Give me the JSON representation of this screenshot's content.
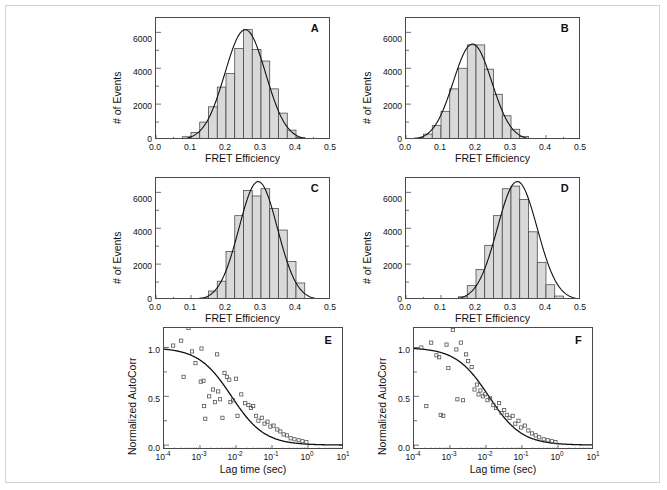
{
  "figure": {
    "panel_letters": [
      "A",
      "B",
      "C",
      "D",
      "E",
      "F"
    ],
    "axis_titles": {
      "fret_x": "FRET Efficiency",
      "events_y": "# of Events",
      "lag_x": "Lag time (sec)",
      "autocorr_y": "Normalized AutoCorr"
    },
    "hist_xticks": [
      "0.0",
      "0.1",
      "0.2",
      "0.3",
      "0.4",
      "0.5"
    ],
    "hist_yticks": [
      "0",
      "2000",
      "4000",
      "6000"
    ],
    "corr_yticks": [
      "0.0",
      "0.5",
      "1.0"
    ],
    "corr_xticks": [
      "10-4",
      "10-3",
      "10-2",
      "10-1",
      "100",
      "101"
    ],
    "corr_xtick_mantissa": "10",
    "corr_xtick_exponents": [
      "-4",
      "-3",
      "-2",
      "-1",
      "0",
      "1"
    ],
    "colors": {
      "bar_fill": "#d9d9d9",
      "bar_edge": "#3a3a3a",
      "fit_line": "#111111",
      "axis": "#4a4a4a",
      "marker_edge": "#555555",
      "page_border": "#d2d2d2",
      "text": "#111111"
    }
  },
  "chart_data": [
    {
      "type": "bar",
      "panel": "A",
      "title": "",
      "xlabel": "FRET Efficiency",
      "ylabel": "# of Events",
      "xlim": [
        0.0,
        0.5
      ],
      "ylim": [
        0,
        6800
      ],
      "grid": false,
      "bin_width": 0.025,
      "bin_centers": [
        0.0625,
        0.0875,
        0.1125,
        0.1375,
        0.1625,
        0.1875,
        0.2125,
        0.2375,
        0.2625,
        0.2875,
        0.3125,
        0.3375,
        0.3625,
        0.3875,
        0.4125
      ],
      "values": [
        70,
        180,
        420,
        1000,
        1850,
        2950,
        3700,
        5100,
        6150,
        5050,
        4400,
        2850,
        1500,
        550,
        150
      ],
      "fit": {
        "type": "gaussian",
        "amplitude": 6150,
        "center": 0.255,
        "sigma": 0.058
      }
    },
    {
      "type": "bar",
      "panel": "B",
      "title": "",
      "xlabel": "FRET Efficiency",
      "ylabel": "# of Events",
      "xlim": [
        0.0,
        0.5
      ],
      "ylim": [
        0,
        6800
      ],
      "grid": false,
      "bin_width": 0.025,
      "bin_centers": [
        0.0375,
        0.0625,
        0.0875,
        0.1125,
        0.1375,
        0.1625,
        0.1875,
        0.2125,
        0.2375,
        0.2625,
        0.2875,
        0.3125,
        0.3375,
        0.3625
      ],
      "values": [
        120,
        330,
        800,
        1600,
        2850,
        4000,
        5300,
        5300,
        3950,
        2550,
        1350,
        600,
        200,
        60
      ],
      "fit": {
        "type": "gaussian",
        "amplitude": 5350,
        "center": 0.19,
        "sigma": 0.055
      }
    },
    {
      "type": "bar",
      "panel": "C",
      "title": "",
      "xlabel": "FRET Efficiency",
      "ylabel": "# of Events",
      "xlim": [
        0.0,
        0.5
      ],
      "ylim": [
        0,
        6800
      ],
      "grid": false,
      "bin_width": 0.025,
      "bin_centers": [
        0.1375,
        0.1625,
        0.1875,
        0.2125,
        0.2375,
        0.2625,
        0.2875,
        0.3125,
        0.3375,
        0.3625,
        0.3875,
        0.4125
      ],
      "values": [
        120,
        500,
        1050,
        2700,
        4700,
        6100,
        5800,
        6200,
        5100,
        3900,
        2150,
        950
      ],
      "fit": {
        "type": "gaussian",
        "amplitude": 6600,
        "center": 0.292,
        "sigma": 0.055
      }
    },
    {
      "type": "bar",
      "panel": "D",
      "title": "",
      "xlabel": "FRET Efficiency",
      "ylabel": "# of Events",
      "xlim": [
        0.0,
        0.5
      ],
      "ylim": [
        0,
        6800
      ],
      "grid": false,
      "bin_width": 0.025,
      "bin_centers": [
        0.1625,
        0.1875,
        0.2125,
        0.2375,
        0.2625,
        0.2875,
        0.3125,
        0.3375,
        0.3625,
        0.3875,
        0.4125,
        0.4375
      ],
      "values": [
        180,
        800,
        1700,
        3050,
        4700,
        6200,
        6350,
        5600,
        3800,
        2100,
        850,
        220
      ],
      "fit": {
        "type": "gaussian",
        "amplitude": 6600,
        "center": 0.318,
        "sigma": 0.057
      }
    },
    {
      "type": "scatter",
      "panel": "E",
      "title": "",
      "xlabel": "Lag time (sec)",
      "ylabel": "Normalized AutoCorr",
      "xscale": "log",
      "xlim": [
        0.0001,
        10
      ],
      "ylim": [
        -0.05,
        1.2
      ],
      "grid": false,
      "marker": "open-square",
      "points": [
        [
          0.00018,
          1.02
        ],
        [
          0.0003,
          1.07
        ],
        [
          0.00048,
          1.2
        ],
        [
          0.0006,
          0.96
        ],
        [
          0.00035,
          0.7
        ],
        [
          0.00075,
          0.84
        ],
        [
          0.0011,
          0.99
        ],
        [
          0.00105,
          0.65
        ],
        [
          0.00125,
          0.66
        ],
        [
          0.0013,
          0.4
        ],
        [
          0.0014,
          0.27
        ],
        [
          0.0018,
          0.5
        ],
        [
          0.0023,
          0.57
        ],
        [
          0.0026,
          0.44
        ],
        [
          0.003,
          0.93
        ],
        [
          0.0032,
          0.55
        ],
        [
          0.0036,
          0.47
        ],
        [
          0.0042,
          0.28
        ],
        [
          0.0048,
          0.74
        ],
        [
          0.0056,
          0.7
        ],
        [
          0.0065,
          0.67
        ],
        [
          0.007,
          0.44
        ],
        [
          0.0083,
          0.46
        ],
        [
          0.01,
          0.68
        ],
        [
          0.011,
          0.3
        ],
        [
          0.014,
          0.52
        ],
        [
          0.018,
          0.43
        ],
        [
          0.022,
          0.41
        ],
        [
          0.026,
          0.38
        ],
        [
          0.03,
          0.4
        ],
        [
          0.036,
          0.3
        ],
        [
          0.042,
          0.25
        ],
        [
          0.052,
          0.28
        ],
        [
          0.062,
          0.22
        ],
        [
          0.075,
          0.24
        ],
        [
          0.09,
          0.19
        ],
        [
          0.11,
          0.2
        ],
        [
          0.14,
          0.16
        ],
        [
          0.17,
          0.14
        ],
        [
          0.21,
          0.11
        ],
        [
          0.26,
          0.1
        ],
        [
          0.33,
          0.07
        ],
        [
          0.42,
          0.06
        ],
        [
          0.55,
          0.05
        ],
        [
          0.7,
          0.04
        ],
        [
          0.9,
          0.03
        ]
      ],
      "fit": {
        "type": "sigmoid-decay",
        "amplitude": 1.0,
        "tau": 0.0075,
        "label": ""
      }
    },
    {
      "type": "scatter",
      "panel": "F",
      "title": "",
      "xlabel": "Lag time (sec)",
      "ylabel": "Normalized AutoCorr",
      "xscale": "log",
      "xlim": [
        0.0001,
        10
      ],
      "ylim": [
        -0.05,
        1.2
      ],
      "grid": false,
      "marker": "open-square",
      "points": [
        [
          0.00016,
          1.0
        ],
        [
          0.00022,
          0.4
        ],
        [
          0.0003,
          1.05
        ],
        [
          0.00042,
          0.92
        ],
        [
          0.0005,
          0.9
        ],
        [
          0.00055,
          0.31
        ],
        [
          0.00065,
          0.3
        ],
        [
          0.0008,
          1.03
        ],
        [
          0.0009,
          0.79
        ],
        [
          0.0012,
          1.18
        ],
        [
          0.0015,
          0.98
        ],
        [
          0.0016,
          0.47
        ],
        [
          0.002,
          1.05
        ],
        [
          0.0023,
          0.46
        ],
        [
          0.0028,
          0.93
        ],
        [
          0.0032,
          0.86
        ],
        [
          0.004,
          0.8
        ],
        [
          0.0048,
          0.57
        ],
        [
          0.0056,
          0.62
        ],
        [
          0.0062,
          0.52
        ],
        [
          0.007,
          0.56
        ],
        [
          0.0082,
          0.5
        ],
        [
          0.0095,
          0.52
        ],
        [
          0.011,
          0.46
        ],
        [
          0.013,
          0.48
        ],
        [
          0.016,
          0.41
        ],
        [
          0.019,
          0.38
        ],
        [
          0.023,
          0.43
        ],
        [
          0.027,
          0.33
        ],
        [
          0.032,
          0.36
        ],
        [
          0.038,
          0.31
        ],
        [
          0.045,
          0.28
        ],
        [
          0.055,
          0.3
        ],
        [
          0.065,
          0.22
        ],
        [
          0.08,
          0.25
        ],
        [
          0.095,
          0.18
        ],
        [
          0.12,
          0.2
        ],
        [
          0.15,
          0.15
        ],
        [
          0.19,
          0.12
        ],
        [
          0.24,
          0.1
        ],
        [
          0.3,
          0.08
        ],
        [
          0.4,
          0.06
        ],
        [
          0.52,
          0.05
        ],
        [
          0.68,
          0.04
        ],
        [
          0.85,
          0.03
        ]
      ],
      "fit": {
        "type": "sigmoid-decay",
        "amplitude": 1.0,
        "tau": 0.012,
        "label": ""
      }
    }
  ]
}
